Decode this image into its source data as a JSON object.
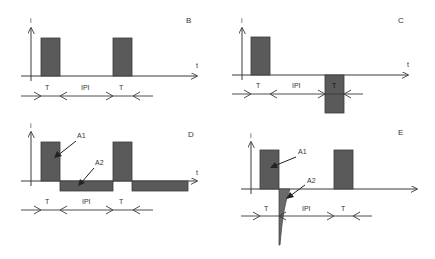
{
  "colors": {
    "pulse_fill": "#5a5a5a",
    "line": "#3a3a3a",
    "background": "#ffffff",
    "text": "#333333"
  },
  "panels": [
    {
      "id": "B",
      "label": "B",
      "y_axis_label": "i",
      "x_axis_label": "t",
      "description": "Monophasic pulse train",
      "dimension_labels": [
        "T",
        "IPI",
        "T"
      ]
    },
    {
      "id": "C",
      "label": "C",
      "y_axis_label": "i",
      "x_axis_label": "t",
      "description": "Biphasic pulse with separated positive and negative phases",
      "dimension_labels": [
        "T",
        "IPI",
        "T"
      ]
    },
    {
      "id": "D",
      "label": "D",
      "y_axis_label": "i",
      "x_axis_label": "t",
      "description": "Charge-balanced pulse with low-amplitude long reverse phase",
      "dimension_labels": [
        "T",
        "IPI",
        "T"
      ],
      "annotations": [
        "A1",
        "A2"
      ]
    },
    {
      "id": "E",
      "label": "E",
      "y_axis_label": "i",
      "x_axis_label": "",
      "description": "Pulse with exponentially decaying reverse spike",
      "dimension_labels": [
        "T",
        "IPI",
        "T"
      ],
      "annotations": [
        "A1",
        "A2"
      ]
    }
  ]
}
